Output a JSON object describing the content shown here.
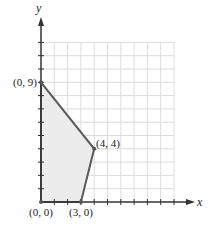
{
  "chart_data": {
    "type": "line",
    "title": "",
    "xlabel": "x",
    "ylabel": "y",
    "xlim": [
      0,
      10
    ],
    "ylim": [
      0,
      12
    ],
    "grid": true,
    "region": {
      "description": "Shaded feasible region (polygon)",
      "vertices": [
        [
          0,
          0
        ],
        [
          3,
          0
        ],
        [
          4,
          4
        ],
        [
          0,
          9
        ]
      ],
      "fill": "#ececec",
      "stroke": "#555555"
    },
    "points": [
      {
        "x": 0,
        "y": 9,
        "label": "(0, 9)"
      },
      {
        "x": 4,
        "y": 4,
        "label": "(4, 4)"
      },
      {
        "x": 0,
        "y": 0,
        "label": "(0, 0)"
      },
      {
        "x": 3,
        "y": 0,
        "label": "(3, 0)"
      }
    ]
  },
  "labels": {
    "x_axis": "x",
    "y_axis": "y",
    "p09": "(0, 9)",
    "p44": "(4, 4)",
    "p00": "(0, 0)",
    "p30": "(3, 0)"
  },
  "colors": {
    "grid": "#dcdcdc",
    "axis": "#333333",
    "region_fill": "#ececec",
    "boundary": "#5a5a5a"
  }
}
